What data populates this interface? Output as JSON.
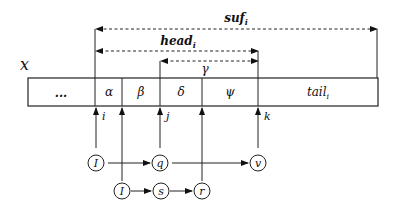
{
  "diagram": {
    "string_label": "x",
    "cells": [
      {
        "label": "...",
        "x0": 28,
        "x1": 95
      },
      {
        "label": "α",
        "x0": 95,
        "x1": 122
      },
      {
        "label": "β",
        "x0": 122,
        "x1": 160
      },
      {
        "label": "δ",
        "x0": 160,
        "x1": 202
      },
      {
        "label": "ψ",
        "x0": 202,
        "x1": 258
      },
      {
        "label": "tail",
        "sub": "i",
        "x0": 258,
        "x1": 378
      }
    ],
    "spans": [
      {
        "label": "suf",
        "sub": "i",
        "from": 95,
        "to": 377,
        "y": 29
      },
      {
        "label": "head",
        "sub": "i",
        "from": 95,
        "to": 258,
        "y": 51
      },
      {
        "label": "γ",
        "from": 160,
        "to": 258,
        "y": 61
      }
    ],
    "pointers": [
      {
        "label": "i",
        "x": 96
      },
      {
        "label": "",
        "x": 122
      },
      {
        "label": "j",
        "x": 160
      },
      {
        "label": "",
        "x": 202
      },
      {
        "label": "k",
        "x": 258
      }
    ],
    "nodes_row1": [
      {
        "label": "I",
        "x": 96
      },
      {
        "label": "q",
        "x": 160
      },
      {
        "label": "v",
        "x": 255
      }
    ],
    "nodes_row2": [
      {
        "label": "I",
        "x": 123
      },
      {
        "label": "s",
        "x": 161
      },
      {
        "label": "r",
        "x": 203
      }
    ]
  }
}
